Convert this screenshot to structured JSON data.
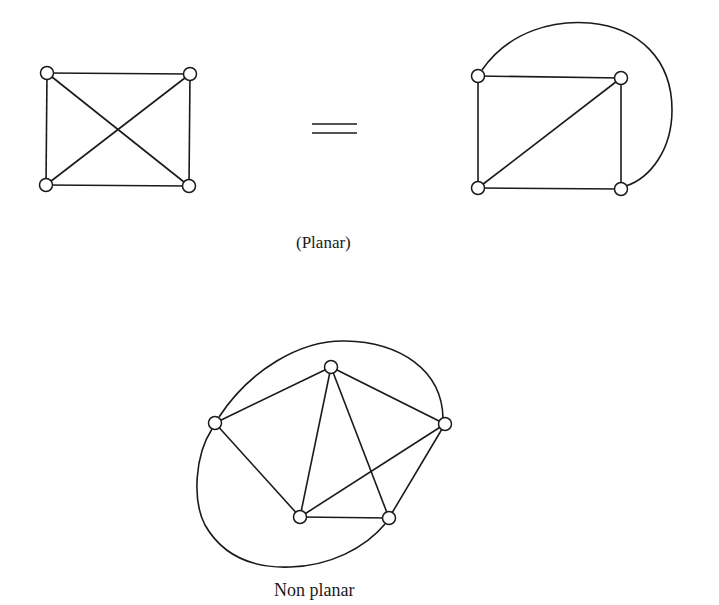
{
  "figure": {
    "equals_sign": "=",
    "planar_label": "(Planar)",
    "nonplanar_label": "Non planar"
  },
  "graphs": [
    {
      "name": "K4 drawn with crossing",
      "nodes": [
        [
          47,
          73
        ],
        [
          190,
          74
        ],
        [
          46,
          185
        ],
        [
          189,
          186
        ]
      ],
      "edges": [
        [
          0,
          1
        ],
        [
          0,
          2
        ],
        [
          1,
          3
        ],
        [
          2,
          3
        ],
        [
          0,
          3
        ],
        [
          1,
          2
        ]
      ]
    },
    {
      "name": "K4 planar embedding",
      "nodes": [
        [
          478,
          76
        ],
        [
          621,
          78
        ],
        [
          478,
          188
        ],
        [
          621,
          189
        ]
      ],
      "edges": [
        [
          0,
          1
        ],
        [
          0,
          2
        ],
        [
          1,
          3
        ],
        [
          2,
          3
        ],
        [
          2,
          1
        ]
      ],
      "curved_edges": [
        [
          0,
          3
        ]
      ]
    },
    {
      "name": "K5 non-planar",
      "nodes": [
        [
          331,
          367
        ],
        [
          215,
          423
        ],
        [
          445,
          424
        ],
        [
          300,
          517
        ],
        [
          389,
          518
        ]
      ],
      "edges": [
        [
          0,
          1
        ],
        [
          0,
          2
        ],
        [
          0,
          3
        ],
        [
          0,
          4
        ],
        [
          1,
          3
        ],
        [
          2,
          3
        ],
        [
          2,
          4
        ],
        [
          3,
          4
        ]
      ],
      "curved_edges": [
        [
          1,
          2
        ],
        [
          1,
          4
        ]
      ]
    }
  ],
  "colors": {
    "ink": "#1a1a1a",
    "background": "#ffffff"
  }
}
